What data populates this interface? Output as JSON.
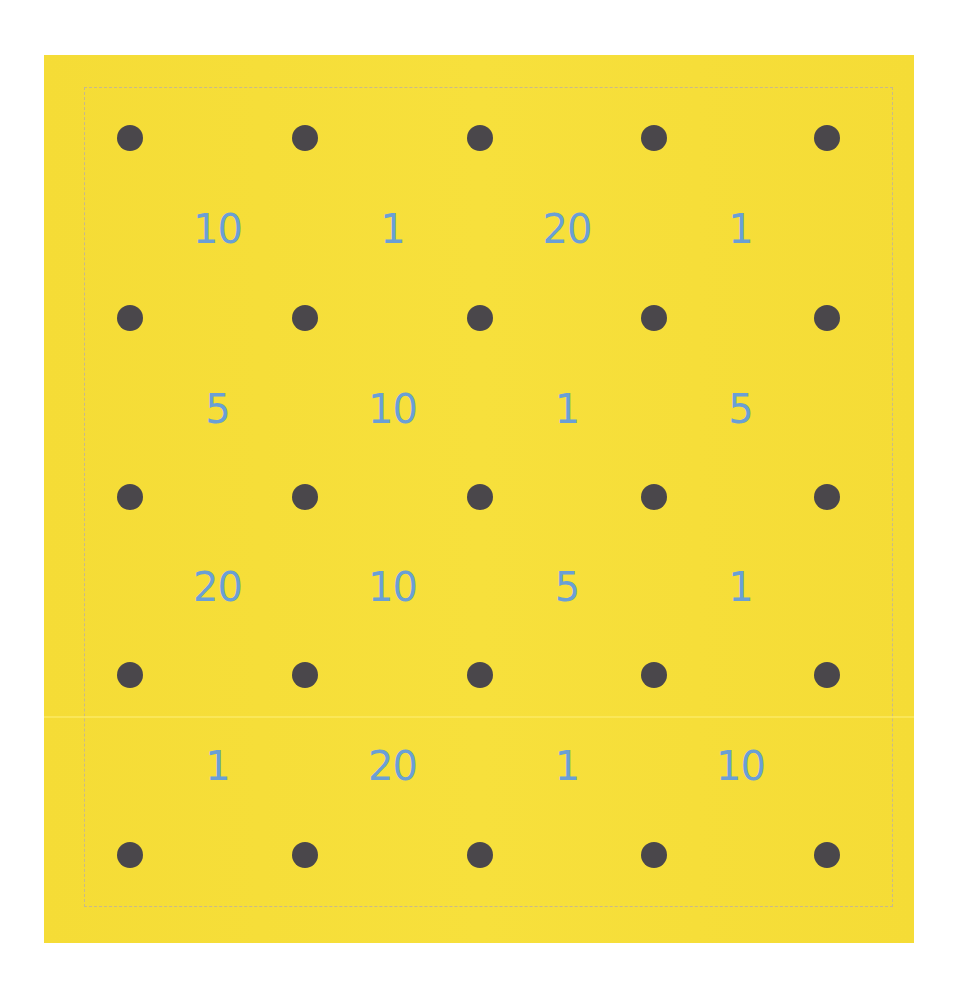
{
  "board": {
    "background_color": "#f6de38",
    "dot_color": "#4a474b",
    "number_color": "#6a9fd6",
    "dot_grid": {
      "rows": 5,
      "cols": 5
    },
    "cells": [
      [
        "10",
        "1",
        "20",
        "1"
      ],
      [
        "5",
        "10",
        "1",
        "5"
      ],
      [
        "20",
        "10",
        "5",
        "1"
      ],
      [
        "1",
        "20",
        "1",
        "10"
      ]
    ]
  }
}
